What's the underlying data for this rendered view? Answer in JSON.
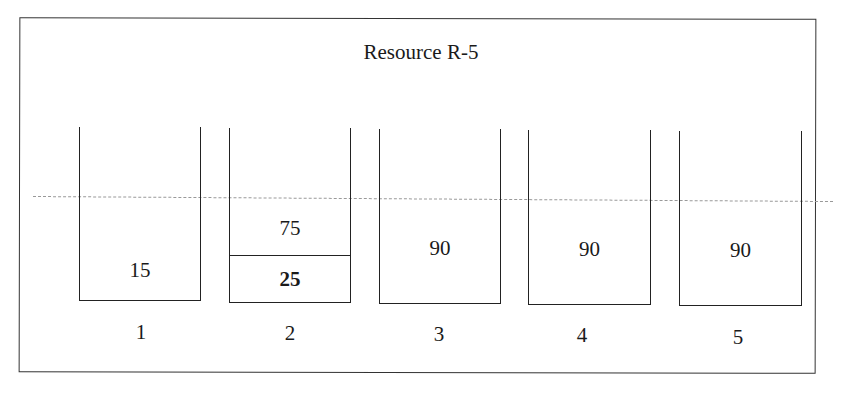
{
  "diagram": {
    "title": "Resource R-5",
    "threshold_line": "dashed",
    "buckets": [
      {
        "label": "1",
        "segments": [
          {
            "value": "15",
            "bold": false
          }
        ]
      },
      {
        "label": "2",
        "segments": [
          {
            "value": "75",
            "bold": false
          },
          {
            "value": "25",
            "bold": true
          }
        ]
      },
      {
        "label": "3",
        "segments": [
          {
            "value": "90",
            "bold": false
          }
        ]
      },
      {
        "label": "4",
        "segments": [
          {
            "value": "90",
            "bold": false
          }
        ]
      },
      {
        "label": "5",
        "segments": [
          {
            "value": "90",
            "bold": false
          }
        ]
      }
    ]
  }
}
